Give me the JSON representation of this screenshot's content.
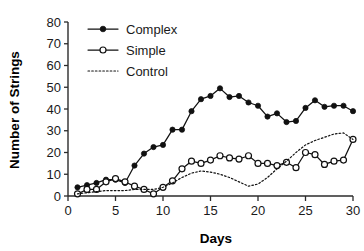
{
  "chart_data": {
    "type": "line",
    "title": "",
    "xlabel": "Days",
    "ylabel": "Number of Strings",
    "xlim": [
      0,
      30
    ],
    "ylim": [
      0,
      80
    ],
    "xticks": [
      0,
      5,
      10,
      15,
      20,
      25,
      30
    ],
    "yticks": [
      0,
      10,
      20,
      30,
      40,
      50,
      60,
      70,
      80
    ],
    "grid": false,
    "legend_position": "top-left",
    "x": [
      1,
      2,
      3,
      4,
      5,
      6,
      7,
      8,
      9,
      10,
      11,
      12,
      13,
      14,
      15,
      16,
      17,
      18,
      19,
      20,
      21,
      22,
      23,
      24,
      25,
      26,
      27,
      28,
      29,
      30
    ],
    "series": [
      {
        "name": "Complex",
        "marker": "filled-circle",
        "line": "solid",
        "color": "#111111",
        "values": [
          4,
          5,
          6,
          7.5,
          7.5,
          6,
          14,
          19.5,
          22.5,
          23.5,
          30.5,
          30.5,
          39,
          44.5,
          46,
          49.5,
          45.5,
          46,
          43,
          41.5,
          36.5,
          38,
          34,
          34.5,
          40.5,
          44,
          41,
          41.5,
          41.5,
          39
        ]
      },
      {
        "name": "Simple",
        "marker": "open-circle",
        "line": "solid",
        "color": "#111111",
        "values": [
          1,
          3,
          3,
          6.5,
          8,
          6.5,
          4.5,
          3,
          1,
          4,
          7,
          12.5,
          16,
          15,
          16.5,
          18.5,
          17.5,
          17,
          18.5,
          15,
          15,
          14,
          15.5,
          13,
          20,
          19,
          14.5,
          16,
          16.5,
          26
        ]
      },
      {
        "name": "Control",
        "marker": "none",
        "line": "dotted",
        "color": "#111111",
        "values": [
          1,
          1.5,
          2,
          2.5,
          2.5,
          2.5,
          3,
          3,
          3,
          4,
          6,
          8.5,
          10.5,
          11.5,
          11,
          10,
          8.5,
          6.5,
          4.5,
          5.5,
          8.5,
          12.5,
          16,
          20,
          23.5,
          25.5,
          27,
          28.5,
          29,
          26
        ]
      }
    ]
  },
  "legend": {
    "entries": [
      {
        "label": "Complex"
      },
      {
        "label": "Simple"
      },
      {
        "label": "Control"
      }
    ]
  },
  "axes": {
    "y_title": "Number of Strings",
    "x_title": "Days",
    "y_tick_labels": [
      "0",
      "10",
      "20",
      "30",
      "40",
      "50",
      "60",
      "70",
      "80"
    ],
    "x_tick_labels": [
      "0",
      "5",
      "10",
      "15",
      "20",
      "25",
      "30"
    ]
  }
}
